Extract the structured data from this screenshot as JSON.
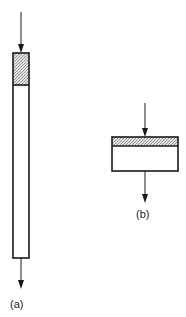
{
  "figure": {
    "panels": [
      {
        "id": "a",
        "label": "(a)",
        "description": "tall column with shaded top section, flow enters top, exits bottom",
        "shape": {
          "x": 13,
          "y": 53,
          "width": 16,
          "height": 205
        },
        "shaded_height": 32,
        "inlet_arrow": {
          "x": 21,
          "y1": 12,
          "y2": 53
        },
        "outlet_arrow": {
          "x": 21,
          "y1": 258,
          "y2": 289
        },
        "label_pos": {
          "x": 10,
          "y": 298
        }
      },
      {
        "id": "b",
        "label": "(b)",
        "description": "short wide bed with thin shaded top band, flow enters top, exits bottom",
        "shape": {
          "x": 112,
          "y": 137,
          "width": 66,
          "height": 34
        },
        "shaded_height": 9,
        "inlet_arrow": {
          "x": 145,
          "y1": 103,
          "y2": 137
        },
        "outlet_arrow": {
          "x": 145,
          "y1": 171,
          "y2": 203
        },
        "label_pos": {
          "x": 136,
          "y": 208
        }
      }
    ],
    "colors": {
      "stroke": "#1a1a1a",
      "shading": "#cfcfcf",
      "background": "#ffffff"
    }
  }
}
